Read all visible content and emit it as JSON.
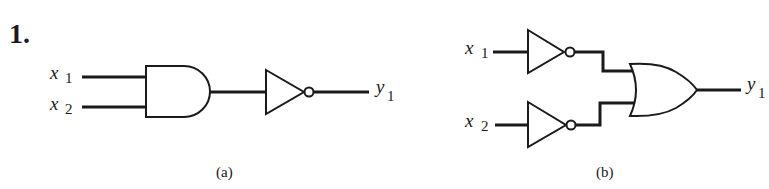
{
  "problem": {
    "number": "1."
  },
  "circuits": [
    {
      "id": "a",
      "caption": "(a)",
      "description": "AND gate followed by NOT gate (NAND)",
      "inputs": [
        {
          "var": "x",
          "sub": "1"
        },
        {
          "var": "x",
          "sub": "2"
        }
      ],
      "gates": [
        "AND",
        "NOT"
      ],
      "output": {
        "var": "y",
        "sub": "1"
      }
    },
    {
      "id": "b",
      "caption": "(b)",
      "description": "Two NOT gates feeding an OR gate",
      "inputs": [
        {
          "var": "x",
          "sub": "1"
        },
        {
          "var": "x",
          "sub": "2"
        }
      ],
      "gates": [
        "NOT",
        "NOT",
        "OR"
      ],
      "output": {
        "var": "y",
        "sub": "1"
      }
    }
  ],
  "colors": {
    "ink": "#1a1a1a",
    "background": "#ffffff"
  }
}
